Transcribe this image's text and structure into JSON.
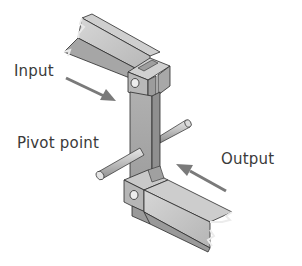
{
  "diagram": {
    "labels": {
      "input": "Input",
      "pivot": "Pivot point",
      "output": "Output"
    },
    "colors": {
      "metal_light": "#c9c9c9",
      "metal_mid": "#a9a9a9",
      "metal_dark": "#8a8a8a",
      "outline": "#2a2a2a",
      "arrow": "#7a7a7a",
      "text": "#3a3a3a"
    },
    "components": [
      {
        "name": "upper-beam",
        "type": "angle-bar"
      },
      {
        "name": "upper-bracket",
        "type": "clevis"
      },
      {
        "name": "lever-arm",
        "type": "vertical-bar"
      },
      {
        "name": "pivot-rod",
        "type": "cylinder"
      },
      {
        "name": "lower-bracket",
        "type": "clevis"
      },
      {
        "name": "lower-beam",
        "type": "angle-bar"
      }
    ],
    "arrows": [
      {
        "name": "input-arrow",
        "direction": "down-right"
      },
      {
        "name": "output-arrow",
        "direction": "up-left"
      }
    ]
  }
}
